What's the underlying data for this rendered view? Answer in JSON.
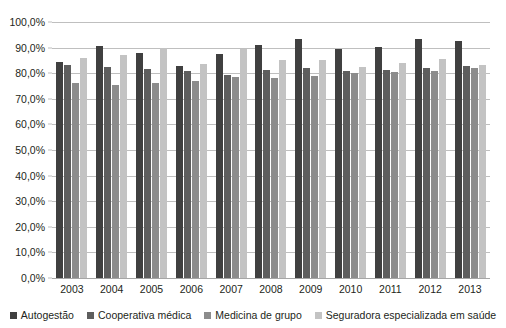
{
  "chart_data": {
    "type": "bar",
    "title": "",
    "subtitle": "",
    "xlabel": "",
    "ylabel": "",
    "ylim": [
      0,
      100
    ],
    "ytick_step": 10,
    "grid": true,
    "legend_position": "bottom",
    "categories": [
      "2003",
      "2004",
      "2005",
      "2006",
      "2007",
      "2008",
      "2009",
      "2010",
      "2011",
      "2012",
      "2013"
    ],
    "ytick_labels": [
      "100,0%",
      "90,0%",
      "80,0%",
      "70,0%",
      "60,0%",
      "50,0%",
      "40,0%",
      "30,0%",
      "20,0%",
      "10,0%",
      "0,0%"
    ],
    "ytick_values": [
      100,
      90,
      80,
      70,
      60,
      50,
      40,
      30,
      20,
      10,
      0
    ],
    "series": [
      {
        "name": "Autogestão",
        "color": "#404040",
        "values": [
          84.5,
          90.7,
          87.9,
          83.0,
          87.5,
          91.2,
          93.2,
          89.5,
          90.3,
          93.5,
          92.5
        ]
      },
      {
        "name": "Cooperativa médica",
        "color": "#5e5e5e",
        "values": [
          83.4,
          82.4,
          81.6,
          80.8,
          79.4,
          81.2,
          82.0,
          80.8,
          81.4,
          81.9,
          82.9
        ]
      },
      {
        "name": "Medicina de grupo",
        "color": "#8c8c8c",
        "values": [
          76.0,
          75.3,
          76.0,
          77.1,
          78.6,
          78.0,
          79.0,
          79.9,
          80.4,
          80.7,
          82.1
        ]
      },
      {
        "name": "Seguradora especializada em saúde",
        "color": "#c3c3c3",
        "values": [
          85.9,
          87.1,
          89.8,
          83.6,
          89.5,
          85.3,
          85.0,
          82.3,
          83.9,
          85.4,
          83.3
        ]
      }
    ]
  }
}
